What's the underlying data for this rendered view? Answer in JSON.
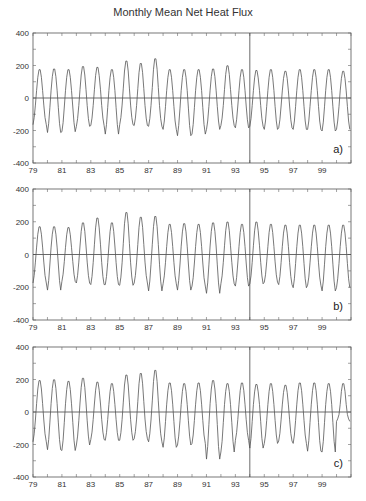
{
  "title": "Monthly Mean Net Heat Flux",
  "chart_data": [
    {
      "type": "line",
      "panel": "a)",
      "title": "Monthly Mean Net Heat Flux",
      "xlabel": "",
      "ylabel": "",
      "xlim": [
        1979,
        2001
      ],
      "ylim": [
        -400,
        400
      ],
      "yticks": [
        -400,
        -200,
        0,
        200,
        400
      ],
      "xtick_labels": [
        "79",
        "81",
        "83",
        "85",
        "87",
        "89",
        "91",
        "93",
        "95",
        "97",
        "99"
      ],
      "vline_x": 1994,
      "hline_y": 0,
      "years": [
        1979,
        1980,
        1981,
        1982,
        1983,
        1984,
        1985,
        1986,
        1987,
        1988,
        1989,
        1990,
        1991,
        1992,
        1993,
        1994,
        1995,
        1996,
        1997,
        1998,
        1999,
        2000
      ],
      "annual_max": [
        180,
        185,
        180,
        200,
        195,
        180,
        235,
        220,
        250,
        180,
        180,
        180,
        185,
        205,
        180,
        175,
        180,
        170,
        180,
        180,
        180,
        170
      ],
      "annual_min": [
        -170,
        -220,
        -215,
        -180,
        -175,
        -230,
        -170,
        -175,
        -180,
        -200,
        -240,
        -230,
        -200,
        -175,
        -190,
        -180,
        -200,
        -190,
        -200,
        -200,
        -210,
        -200
      ]
    },
    {
      "type": "line",
      "panel": "b)",
      "xlim": [
        1979,
        2001
      ],
      "ylim": [
        -400,
        400
      ],
      "yticks": [
        -400,
        -200,
        0,
        200,
        400
      ],
      "xtick_labels": [
        "79",
        "81",
        "83",
        "85",
        "87",
        "89",
        "91",
        "93",
        "95",
        "97",
        "99"
      ],
      "vline_x": 1994,
      "hline_y": 0,
      "years": [
        1979,
        1980,
        1981,
        1982,
        1983,
        1984,
        1985,
        1986,
        1987,
        1988,
        1989,
        1990,
        1991,
        1992,
        1993,
        1994,
        1995,
        1996,
        1997,
        1998,
        1999,
        2000
      ],
      "annual_max": [
        175,
        175,
        170,
        200,
        230,
        200,
        265,
        235,
        240,
        190,
        195,
        190,
        200,
        205,
        190,
        205,
        190,
        185,
        185,
        185,
        185,
        185
      ],
      "annual_min": [
        -180,
        -225,
        -170,
        -180,
        -190,
        -190,
        -195,
        -180,
        -230,
        -185,
        -225,
        -200,
        -245,
        -185,
        -200,
        -185,
        -175,
        -190,
        -210,
        -195,
        -230,
        -210
      ]
    },
    {
      "type": "line",
      "panel": "c)",
      "xlim": [
        1979,
        2001
      ],
      "ylim": [
        -400,
        400
      ],
      "yticks": [
        -400,
        -200,
        0,
        200,
        400
      ],
      "xtick_labels": [
        "79",
        "81",
        "83",
        "85",
        "87",
        "89",
        "91",
        "93",
        "95",
        "97",
        "99"
      ],
      "vline_x": 1994,
      "hline_y": 0,
      "years": [
        1979,
        1980,
        1981,
        1982,
        1983,
        1984,
        1985,
        1986,
        1987,
        1988,
        1989,
        1990,
        1991,
        1992,
        1993,
        1994,
        1995,
        1996,
        1997,
        1998,
        1999,
        2000
      ],
      "annual_max": [
        200,
        205,
        195,
        215,
        190,
        180,
        235,
        245,
        265,
        185,
        180,
        185,
        200,
        180,
        185,
        175,
        180,
        170,
        185,
        185,
        180,
        180
      ],
      "annual_min": [
        -190,
        -240,
        -245,
        -210,
        -175,
        -180,
        -180,
        -170,
        -190,
        -225,
        -210,
        -200,
        -300,
        -255,
        -180,
        -230,
        -200,
        -185,
        -200,
        -250,
        -255,
        -60
      ]
    }
  ]
}
